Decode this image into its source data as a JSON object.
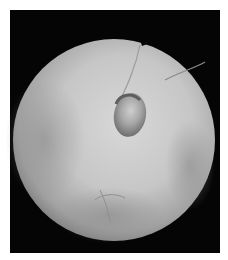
{
  "image": {
    "description": "Endoscopic circular view of tissue with central dark lumen/opening",
    "colors": {
      "background": "#ffffff",
      "frame": "#050505",
      "tissue_light": "#d4d4d4",
      "tissue_mid": "#b0b0b0",
      "tissue_dark": "#6a6a6a"
    }
  }
}
